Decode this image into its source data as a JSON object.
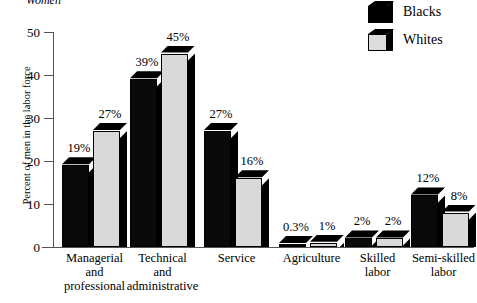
{
  "chart_data": {
    "type": "bar",
    "title": "Women",
    "xlabel": "",
    "ylabel": "Percent of men in the labor force",
    "ylim": [
      0,
      50
    ],
    "yticks": [
      0,
      10,
      20,
      30,
      40,
      50
    ],
    "grid": false,
    "legend_position": "top-right",
    "categories": [
      "Managerial and professional",
      "Technical and administrative",
      "Service",
      "Agriculture",
      "Skilled labor",
      "Semi-skilled labor"
    ],
    "category_lines": [
      [
        "Managerial",
        "and",
        "professional"
      ],
      [
        "Technical",
        "and",
        "administrative"
      ],
      [
        "Service"
      ],
      [
        "Agriculture"
      ],
      [
        "Skilled",
        "labor"
      ],
      [
        "Semi-skilled",
        "labor"
      ]
    ],
    "series": [
      {
        "name": "Blacks",
        "color": "#0a0a0a",
        "values": [
          19,
          39,
          27,
          0.3,
          2,
          12
        ],
        "labels": [
          "19%",
          "39%",
          "27%",
          "0.3%",
          "2%",
          "12%"
        ]
      },
      {
        "name": "Whites",
        "color": "#d9d9d9",
        "values": [
          27,
          45,
          16,
          1,
          2,
          8
        ],
        "labels": [
          "27%",
          "45%",
          "16%",
          "1%",
          "2%",
          "8%"
        ]
      }
    ]
  },
  "axis": {
    "y_title": "Percent of men in the labor force",
    "y_tick_labels": [
      "50",
      "40",
      "30",
      "20",
      "10",
      "0"
    ]
  },
  "legend": {
    "items": [
      {
        "label": "Blacks",
        "swatch": "black-cube-icon"
      },
      {
        "label": "Whites",
        "swatch": "white-cube-icon"
      }
    ]
  }
}
